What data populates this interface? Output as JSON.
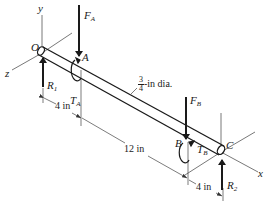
{
  "diagram": {
    "type": "shaft free-body diagram",
    "colors": {
      "line": "#1a1a1a",
      "axis": "#555555",
      "background": "#ffffff"
    },
    "axes": {
      "x": "x",
      "y": "y",
      "z": "z",
      "origin": "O"
    },
    "points": {
      "A": "A",
      "B": "B",
      "C": "C"
    },
    "forces": {
      "FA": {
        "symbol": "F",
        "sub": "A"
      },
      "FB": {
        "symbol": "F",
        "sub": "B"
      },
      "R1": {
        "symbol": "R",
        "sub": "1"
      },
      "R2": {
        "symbol": "R",
        "sub": "2"
      }
    },
    "torques": {
      "TA": {
        "symbol": "T",
        "sub": "A"
      },
      "TB": {
        "symbol": "T",
        "sub": "B"
      }
    },
    "dimensions": {
      "OA": "4 in",
      "AB": "12 in",
      "BC": "4 in"
    },
    "diameter": {
      "num": "3",
      "den": "4",
      "suffix": "-in dia."
    }
  }
}
